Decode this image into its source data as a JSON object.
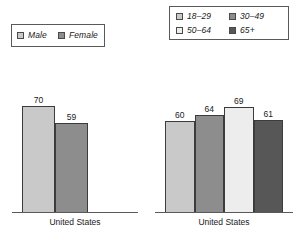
{
  "chart_data": [
    {
      "type": "bar",
      "id": "gender-chart",
      "title": "",
      "xlabel": "United States",
      "ylabel": "",
      "categories": [
        "United States"
      ],
      "grid": false,
      "legend_position": "top-left",
      "ylim": [
        0,
        100
      ],
      "legend": [
        {
          "label": "Male",
          "color": "#c9c9c9"
        },
        {
          "label": "Female",
          "color": "#8d8d8d"
        }
      ],
      "series": [
        {
          "name": "Male",
          "values": [
            70
          ],
          "color": "#c9c9c9"
        },
        {
          "name": "Female",
          "values": [
            59
          ],
          "color": "#8d8d8d"
        }
      ],
      "bars": [
        {
          "label": "Male",
          "value": 70,
          "display": "70",
          "color": "#c9c9c9"
        },
        {
          "label": "Female",
          "value": 59,
          "display": "59",
          "color": "#8d8d8d"
        }
      ]
    },
    {
      "type": "bar",
      "id": "age-chart",
      "title": "",
      "xlabel": "United States",
      "ylabel": "",
      "categories": [
        "United States"
      ],
      "grid": false,
      "legend_position": "top",
      "ylim": [
        0,
        100
      ],
      "legend": [
        {
          "label": "18–29",
          "color": "#c9c9c9"
        },
        {
          "label": "30–49",
          "color": "#8d8d8d"
        },
        {
          "label": "50–64",
          "color": "#ededed"
        },
        {
          "label": "65+",
          "color": "#575757"
        }
      ],
      "series": [
        {
          "name": "18–29",
          "values": [
            60
          ],
          "color": "#c9c9c9"
        },
        {
          "name": "30–49",
          "values": [
            64
          ],
          "color": "#8d8d8d"
        },
        {
          "name": "50–64",
          "values": [
            69
          ],
          "color": "#ededed"
        },
        {
          "name": "65+",
          "values": [
            61
          ],
          "color": "#575757"
        }
      ],
      "bars": [
        {
          "label": "18–29",
          "value": 60,
          "display": "60",
          "color": "#c9c9c9"
        },
        {
          "label": "30–49",
          "value": 64,
          "display": "64",
          "color": "#8d8d8d"
        },
        {
          "label": "50–64",
          "value": 69,
          "display": "69",
          "color": "#ededed"
        },
        {
          "label": "65+",
          "value": 61,
          "display": "61",
          "color": "#575757"
        }
      ]
    }
  ]
}
